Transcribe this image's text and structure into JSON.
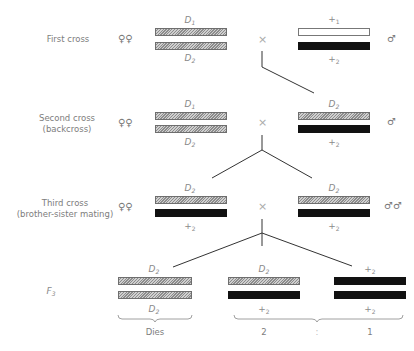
{
  "rows": [
    {
      "label": [
        "First cross"
      ],
      "female_symbol": "♀♀",
      "male_symbol": "♂",
      "cross_symbol": "×",
      "left": {
        "top_allele": "D",
        "top_sub": "1",
        "bottom_allele": "D",
        "bottom_sub": "2",
        "bars": [
          "hatched",
          "hatched"
        ]
      },
      "right": {
        "top_allele": "+",
        "top_sub": "1",
        "bottom_allele": "+",
        "bottom_sub": "2",
        "bars": [
          "white",
          "black"
        ]
      }
    },
    {
      "label": [
        "Second cross",
        "(backcross)"
      ],
      "female_symbol": "♀♀",
      "male_symbol": "♂",
      "cross_symbol": "×",
      "left": {
        "top_allele": "D",
        "top_sub": "1",
        "bottom_allele": "D",
        "bottom_sub": "2",
        "bars": [
          "hatched",
          "hatched"
        ]
      },
      "right": {
        "top_allele": "D",
        "top_sub": "2",
        "bottom_allele": "+",
        "bottom_sub": "2",
        "bars": [
          "hatched",
          "black"
        ]
      }
    },
    {
      "label": [
        "Third cross",
        "(brother-sister mating)"
      ],
      "female_symbol": "♀♀",
      "male_symbol": "♂♂",
      "cross_symbol": "×",
      "left": {
        "top_allele": "D",
        "top_sub": "2",
        "bottom_allele": "+",
        "bottom_sub": "2",
        "bars": [
          "hatched",
          "black"
        ]
      },
      "right": {
        "top_allele": "D",
        "top_sub": "2",
        "bottom_allele": "+",
        "bottom_sub": "2",
        "bars": [
          "hatched",
          "black"
        ]
      }
    }
  ],
  "f3": {
    "label": "F",
    "label_sub": "3",
    "offspring": [
      {
        "top_allele": "D",
        "top_sub": "2",
        "bottom_allele": "D",
        "bottom_sub": "2",
        "bars": [
          "hatched",
          "hatched"
        ],
        "outcome": "Dies"
      },
      {
        "top_allele": "D",
        "top_sub": "2",
        "bottom_allele": "+",
        "bottom_sub": "2",
        "bars": [
          "hatched",
          "black"
        ],
        "outcome": "2"
      },
      {
        "top_allele": "+",
        "top_sub": "2",
        "bottom_allele": "+",
        "bottom_sub": "2",
        "bars": [
          "black",
          "black"
        ],
        "outcome": "1"
      }
    ],
    "ratio_separator": ":"
  }
}
